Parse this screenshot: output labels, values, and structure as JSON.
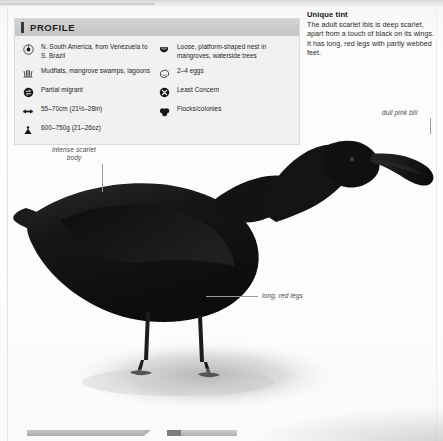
{
  "profile": {
    "title": "PROFILE",
    "left_items": [
      {
        "icon": "range-globe-icon",
        "text": "N. South America, from Venezuela to S. Brazil"
      },
      {
        "icon": "habitat-reeds-icon",
        "text": "Mudflats, mangrove swamps, lagoons"
      },
      {
        "icon": "migration-arrows-icon",
        "text": "Partial migrant"
      },
      {
        "icon": "length-double-arrow-icon",
        "text": "55–70cm (21½–28in)"
      },
      {
        "icon": "weight-icon",
        "text": "600–750g (21–26oz)"
      }
    ],
    "right_items": [
      {
        "icon": "nest-icon",
        "text": "Loose, platform-shaped nest in mangroves, waterside trees"
      },
      {
        "icon": "egg-icon",
        "text": "2–4 eggs"
      },
      {
        "icon": "conservation-status-icon",
        "text": "Least Concern"
      },
      {
        "icon": "flock-icon",
        "text": "Flocks/colonies"
      }
    ]
  },
  "callout": {
    "title": "Unique tint",
    "body": "The adult scarlet ibis is deep scarlet, apart from a touch of black on its wings. It has long, red legs with partly webbed feet."
  },
  "annotations": {
    "body": "intense scarlet body",
    "bill": "dull pink bill",
    "legs": "long, red legs"
  },
  "illustration": {
    "subject": "scarlet-ibis-silhouette",
    "colors": {
      "body": "#131313",
      "bill": "#1a1a1a",
      "legs": "#1c1c1c",
      "shadow": "#b9b9b9"
    }
  }
}
